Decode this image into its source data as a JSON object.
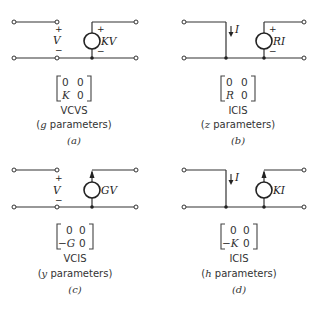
{
  "panels": [
    {
      "id": "a",
      "type": "VCVS",
      "parameter_letter": "g",
      "caption_suffix": " parameters)",
      "caption_prefix": "(",
      "sub_label": "(a)",
      "control": {
        "kind": "voltage",
        "label": "V",
        "plus": "+",
        "minus": "−"
      },
      "source": {
        "kind": "voltage",
        "label": "KV",
        "plus": "+",
        "minus": "−"
      },
      "matrix": [
        [
          "0",
          "0"
        ],
        [
          "K",
          "0"
        ]
      ]
    },
    {
      "id": "b",
      "type": "ICIS",
      "parameter_letter": "z",
      "caption_suffix": " parameters)",
      "caption_prefix": "(",
      "sub_label": "(b)",
      "control": {
        "kind": "current",
        "label": "I"
      },
      "source": {
        "kind": "voltage",
        "label": "RI",
        "plus": "+",
        "minus": "−"
      },
      "matrix": [
        [
          "0",
          "0"
        ],
        [
          "R",
          "0"
        ]
      ]
    },
    {
      "id": "c",
      "type": "VCIS",
      "parameter_letter": "y",
      "caption_suffix": " parameters)",
      "caption_prefix": "(",
      "sub_label": "(c)",
      "control": {
        "kind": "voltage",
        "label": "V",
        "plus": "+",
        "minus": "−"
      },
      "source": {
        "kind": "current",
        "label": "GV"
      },
      "matrix": [
        [
          "0",
          "0"
        ],
        [
          "−G",
          "0"
        ]
      ]
    },
    {
      "id": "d",
      "type": "ICIS",
      "parameter_letter": "h",
      "caption_suffix": " parameters)",
      "caption_prefix": "(",
      "sub_label": "(d)",
      "control": {
        "kind": "current",
        "label": "I"
      },
      "source": {
        "kind": "current",
        "label": "KI"
      },
      "matrix": [
        [
          "0",
          "0"
        ],
        [
          "−K",
          "0"
        ]
      ]
    }
  ]
}
